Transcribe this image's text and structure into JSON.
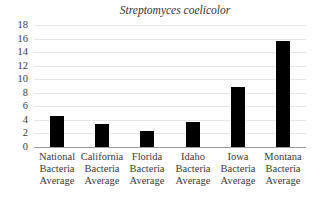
{
  "chart_data": {
    "type": "bar",
    "title": "Streptomyces coelicolor",
    "xlabel": "",
    "ylabel": "",
    "ylim": [
      0,
      18
    ],
    "yticks": [
      0,
      2,
      4,
      6,
      8,
      10,
      12,
      14,
      16,
      18
    ],
    "grid": true,
    "legend": null,
    "categories": [
      "National Bacteria Average",
      "California Bacteria Average",
      "Florida Bacteria Average",
      "Idaho Bacteria Average",
      "Iowa Bacteria Average",
      "Montana Bacteria Average"
    ],
    "category_lines": [
      [
        "National",
        "Bacteria",
        "Average"
      ],
      [
        "California",
        "Bacteria",
        "Average"
      ],
      [
        "Florida",
        "Bacteria",
        "Average"
      ],
      [
        "Idaho",
        "Bacteria",
        "Average"
      ],
      [
        "Iowa",
        "Bacteria",
        "Average"
      ],
      [
        "Montana",
        "Bacteria",
        "Average"
      ]
    ],
    "values": [
      4.6,
      3.4,
      2.4,
      3.7,
      8.8,
      15.7
    ],
    "bar_color": "#000000"
  }
}
